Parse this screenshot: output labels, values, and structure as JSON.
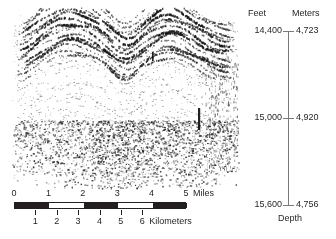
{
  "figure": {
    "type": "seismic-reflection-profile"
  },
  "horizontal_scale": {
    "miles": {
      "unit_label": "Miles",
      "ticks": [
        "0",
        "1",
        "2",
        "3",
        "4",
        "5"
      ],
      "values": [
        0,
        1,
        2,
        3,
        4,
        5
      ],
      "bar_fill_segments": [
        [
          0,
          1
        ],
        [
          2,
          3
        ],
        [
          4,
          5
        ]
      ]
    },
    "kilometers": {
      "unit_label": "Kilometers",
      "ticks": [
        "1",
        "2",
        "3",
        "4",
        "5",
        "6"
      ],
      "values": [
        1,
        2,
        3,
        4,
        5,
        6
      ],
      "miles_per_km": 0.621371
    }
  },
  "depth_axis": {
    "caption": "Depth",
    "headers": {
      "feet": "Feet",
      "meters": "Meters"
    },
    "ticks": [
      {
        "feet": "14,400",
        "meters": "4,723",
        "position": 0
      },
      {
        "feet": "15,000",
        "meters": "4,920",
        "position": 0.5
      },
      {
        "feet": "15,600",
        "meters": "4,756",
        "position": 1
      }
    ]
  },
  "colors": {
    "ink": "#231f20",
    "axis": "#7a7a7a",
    "background": "#ffffff"
  }
}
